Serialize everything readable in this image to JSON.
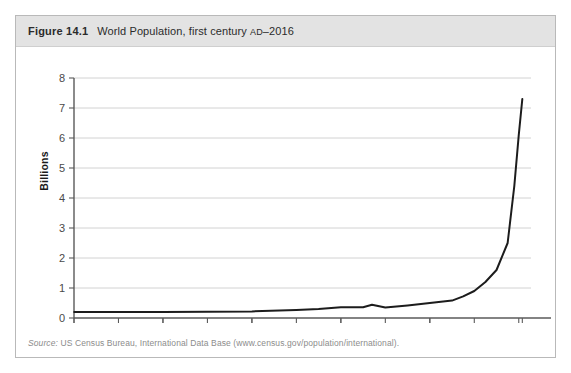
{
  "figure": {
    "number": "Figure 14.1",
    "title_pre": "World Population, first century ",
    "title_era": "AD",
    "title_post": "–2016",
    "full_title": "Figure 14.1  World Population, first century AD–2016"
  },
  "source": {
    "label": "Source:",
    "text": " US Census Bureau, International Data Base (www.census.gov/population/international)."
  },
  "colors": {
    "caption_band": "#e3e3e3",
    "box_border": "#b9b9b9",
    "gridline": "#d2d2d2",
    "axis": "#5a5a5a",
    "line": "#1c1c1c",
    "tick_label": "#4a4a4a"
  },
  "chart_data": {
    "type": "line",
    "title": "World Population, first century AD–2016",
    "xlabel": "",
    "ylabel": "Billions",
    "xlim": [
      0,
      2100
    ],
    "ylim": [
      0,
      8
    ],
    "grid": true,
    "legend": "none",
    "ytick_labels": [
      "0",
      "1",
      "2",
      "3",
      "4",
      "5",
      "6",
      "7",
      "8"
    ],
    "ytick_values": [
      0,
      1,
      2,
      3,
      4,
      5,
      6,
      7,
      8
    ],
    "xtick_labels": [
      "0",
      "400",
      "800",
      "1200",
      "1600",
      "2016"
    ],
    "xtick_values": [
      0,
      400,
      800,
      1200,
      1600,
      2016
    ],
    "x_minor_tick_interval": 200,
    "series": [
      {
        "name": "World population",
        "units": "billions",
        "x": [
          1,
          200,
          400,
          600,
          800,
          1000,
          1100,
          1200,
          1300,
          1340,
          1400,
          1500,
          1600,
          1700,
          1750,
          1800,
          1850,
          1900,
          1950,
          1980,
          2000,
          2016
        ],
        "values": [
          0.2,
          0.2,
          0.2,
          0.21,
          0.22,
          0.27,
          0.3,
          0.36,
          0.36,
          0.44,
          0.35,
          0.42,
          0.5,
          0.58,
          0.72,
          0.9,
          1.2,
          1.6,
          2.5,
          4.4,
          6.1,
          7.3
        ]
      }
    ]
  }
}
